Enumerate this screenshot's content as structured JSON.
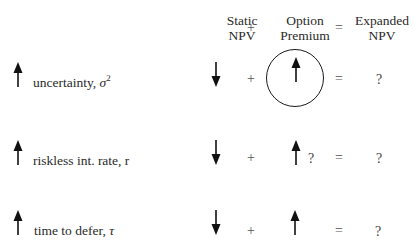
{
  "header": {
    "static_npv_line1": "Static",
    "static_npv_line2": "NPV",
    "plus": "+",
    "option_premium_line1": "Option",
    "option_premium_line2": "Premium",
    "equals": "=",
    "expanded_npv_line1": "Expanded",
    "expanded_npv_line2": "NPV"
  },
  "rows": [
    {
      "factor_direction": "up-arrow",
      "label_text": "uncertainty, ",
      "label_symbol": "σ",
      "label_sup": "2",
      "static_npv": "down-arrow",
      "plus": "+",
      "option_premium": "up-arrow",
      "option_premium_circled": true,
      "option_premium_qualifier": "",
      "equals": "=",
      "expanded_npv": "?"
    },
    {
      "factor_direction": "up-arrow",
      "label_text": "riskless int. rate, r",
      "label_symbol": "",
      "label_sup": "",
      "static_npv": "down-arrow",
      "plus": "+",
      "option_premium": "up-arrow",
      "option_premium_circled": false,
      "option_premium_qualifier": "?",
      "equals": "=",
      "expanded_npv": "?"
    },
    {
      "factor_direction": "up-arrow",
      "label_text": "time to defer, ",
      "label_symbol": "τ",
      "label_sup": "",
      "static_npv": "down-arrow",
      "plus": "+",
      "option_premium": "up-arrow",
      "option_premium_circled": false,
      "option_premium_qualifier": "",
      "equals": "=",
      "expanded_npv": "?"
    }
  ]
}
